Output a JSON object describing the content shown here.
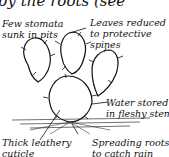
{
  "header": {
    "partial_text": "by the roots (see"
  },
  "labels": {
    "stomata": [
      "Few stomata",
      "sunk in pits"
    ],
    "leaves": [
      "Leaves reduced",
      "to protective",
      "spines"
    ],
    "water": [
      "Water stored",
      "in fleshy stem"
    ],
    "cuticle": [
      "Thick leathery",
      "cuticle"
    ],
    "roots": [
      "Spreading roots",
      "to catch rain"
    ]
  }
}
